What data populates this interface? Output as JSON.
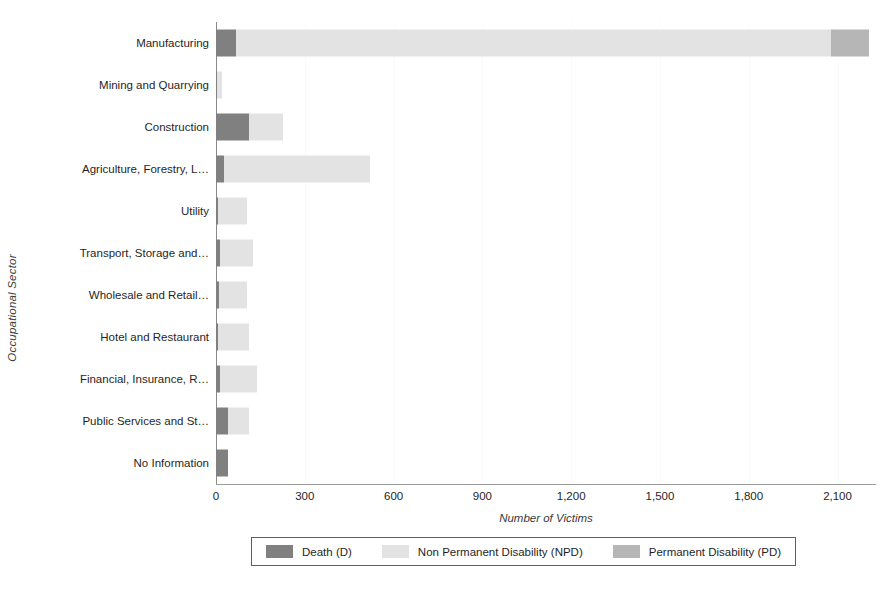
{
  "chart_data": {
    "type": "bar",
    "orientation": "horizontal",
    "stacked": true,
    "title": "",
    "xlabel": "Number of Victims",
    "ylabel": "Occupational Sector",
    "xlim": [
      0,
      2230
    ],
    "grid": true,
    "legend_position": "bottom",
    "xticks": [
      "0",
      "300",
      "600",
      "900",
      "1,200",
      "1,500",
      "1,800",
      "2,100"
    ],
    "xtick_values": [
      0,
      300,
      600,
      900,
      1200,
      1500,
      1800,
      2100
    ],
    "categories": [
      "Manufacturing",
      "Mining and Quarrying",
      "Construction",
      "Agriculture, Forestry, L…",
      "Utility",
      "Transport, Storage and…",
      "Wholesale and Retail…",
      "Hotel and Restaurant",
      "Financial, Insurance, R…",
      "Public Services and St…",
      "No Information"
    ],
    "series": [
      {
        "name": "Death (D)",
        "key": "d",
        "color": "#808080",
        "values": [
          68,
          5,
          110,
          26,
          8,
          14,
          9,
          8,
          12,
          42,
          40
        ]
      },
      {
        "name": "Non Permanent Disability (NPD)",
        "key": "npd",
        "color": "#e3e3e3",
        "values": [
          2010,
          15,
          115,
          494,
          97,
          111,
          96,
          105,
          126,
          68,
          0
        ]
      },
      {
        "name": "Permanent Disability (PD)",
        "key": "pd",
        "color": "#b6b6b6",
        "values": [
          130,
          0,
          0,
          0,
          0,
          0,
          0,
          0,
          0,
          0,
          0
        ]
      }
    ],
    "totals": [
      2208,
      20,
      225,
      520,
      105,
      125,
      105,
      113,
      138,
      110,
      40
    ]
  },
  "legend": {
    "items": [
      {
        "label": "Death (D)",
        "color": "#808080"
      },
      {
        "label": "Non Permanent Disability (NPD)",
        "color": "#e3e3e3"
      },
      {
        "label": "Permanent Disability (PD)",
        "color": "#b6b6b6"
      }
    ]
  }
}
